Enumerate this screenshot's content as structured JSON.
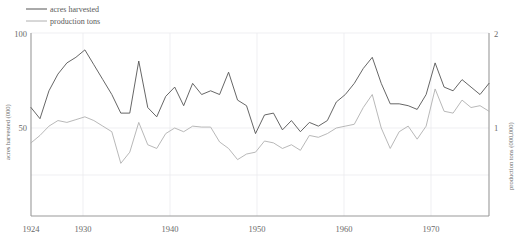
{
  "chart_data": {
    "type": "line",
    "title": "",
    "xlabel": "",
    "x": [
      1924,
      1925,
      1926,
      1927,
      1928,
      1929,
      1930,
      1931,
      1932,
      1933,
      1934,
      1935,
      1936,
      1937,
      1938,
      1939,
      1940,
      1941,
      1942,
      1943,
      1944,
      1945,
      1946,
      1947,
      1948,
      1949,
      1950,
      1951,
      1952,
      1953,
      1954,
      1955,
      1956,
      1957,
      1958,
      1959,
      1960,
      1961,
      1962,
      1963,
      1964,
      1965,
      1966,
      1967,
      1968,
      1969,
      1970,
      1971,
      1972,
      1973,
      1974,
      1975
    ],
    "xlim": [
      1924,
      1975
    ],
    "xticks": [
      1924,
      1930,
      1940,
      1950,
      1960,
      1970
    ],
    "xtick_labels": [
      "1924",
      "1930",
      "1940",
      "1950",
      "1960",
      "1970"
    ],
    "grid": true,
    "legend_position": "top-left",
    "series": [
      {
        "name": "acres harvested",
        "axis": "left",
        "color": "#555555",
        "ylabel": "acres harvested (000)",
        "ylim": [
          0,
          100
        ],
        "yticks": [
          50,
          100
        ],
        "ytick_labels": [
          "50",
          "100"
        ],
        "values": [
          61,
          55,
          70,
          79,
          85,
          88,
          92,
          84,
          76,
          68,
          58,
          58,
          86,
          61,
          56,
          67,
          72,
          62,
          74,
          68,
          70,
          68,
          80,
          65,
          62,
          47,
          57,
          58,
          49,
          54,
          48,
          53,
          51,
          54,
          64,
          68,
          74,
          82,
          88,
          74,
          63,
          63,
          62,
          60,
          68,
          85,
          72,
          70,
          76,
          72,
          68,
          74
        ]
      },
      {
        "name": "production tons",
        "axis": "right",
        "color": "#b0b0b0",
        "ylabel": "production tons (000,000)",
        "ylim": [
          0,
          2
        ],
        "yticks": [
          1,
          2
        ],
        "ytick_labels": [
          "1",
          "2"
        ],
        "values": [
          0.84,
          0.92,
          1.02,
          1.08,
          1.06,
          1.09,
          1.12,
          1.08,
          1.02,
          0.96,
          0.62,
          0.74,
          1.06,
          0.82,
          0.78,
          0.94,
          1.0,
          0.96,
          1.02,
          1.01,
          1.01,
          0.85,
          0.78,
          0.66,
          0.72,
          0.74,
          0.86,
          0.84,
          0.78,
          0.82,
          0.76,
          0.92,
          0.9,
          0.94,
          1.0,
          1.02,
          1.04,
          1.22,
          1.36,
          1.0,
          0.78,
          0.96,
          1.02,
          0.88,
          1.02,
          1.42,
          1.18,
          1.16,
          1.3,
          1.22,
          1.24,
          1.18
        ]
      }
    ]
  },
  "legend": {
    "items": [
      {
        "label": "acres harvested",
        "color": "#555555"
      },
      {
        "label": "production tons",
        "color": "#b0b0b0"
      }
    ]
  },
  "axes": {
    "left": {
      "title": "acres harvested (000)",
      "tick_top": "100",
      "tick_mid": "50"
    },
    "right": {
      "title": "production tons (000,000)",
      "tick_top": "2",
      "tick_mid": "1"
    },
    "bottom": {
      "ticks": [
        "1924",
        "1930",
        "1940",
        "1950",
        "1960",
        "1970"
      ]
    }
  }
}
